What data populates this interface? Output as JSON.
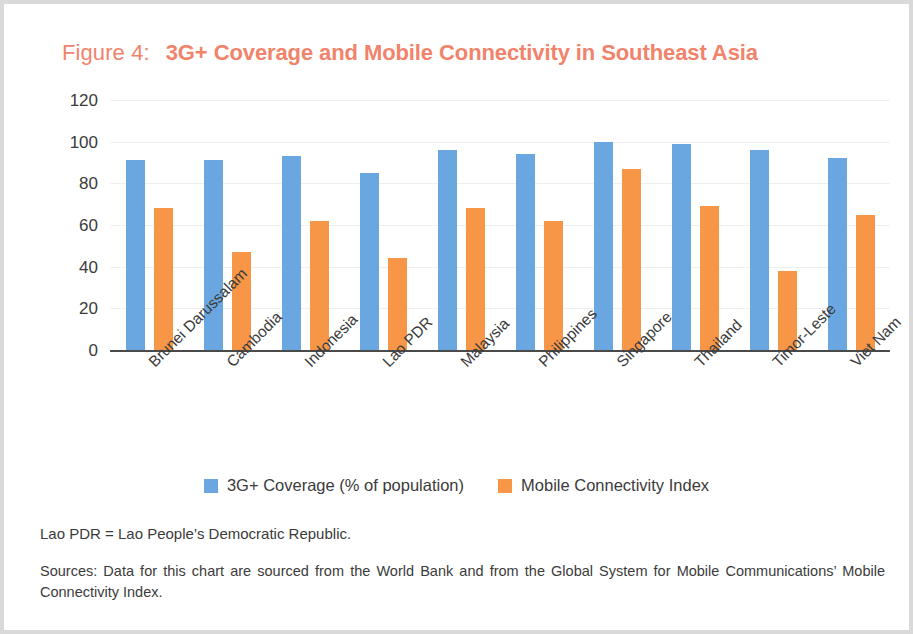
{
  "figure": {
    "label": "Figure 4:",
    "title": "3G+ Coverage and Mobile Connectivity in Southeast Asia"
  },
  "notes": {
    "abbreviation": "Lao PDR = Lao People’s Democratic Republic.",
    "source": "Sources: Data for this chart are sourced from the World Bank and from the Global System for Mobile Communications’ Mobile Connectivity Index."
  },
  "colors": {
    "title": "#f2836b",
    "series_1": "#6aa7e0",
    "series_2": "#f79646",
    "axis": "#4a4a4a",
    "grid": "#efefef",
    "text": "#3b3b3b",
    "frame": "#d9d9d9"
  },
  "chart_data": {
    "type": "bar",
    "title": "3G+ Coverage and Mobile Connectivity in Southeast Asia",
    "xlabel": "",
    "ylabel": "",
    "ylim": [
      0,
      120
    ],
    "yticks": [
      120,
      100,
      80,
      60,
      40,
      20,
      0
    ],
    "grid": true,
    "legend_position": "bottom-center",
    "categories": [
      "Brunei Darussalam",
      "Cambodia",
      "Indonesia",
      "Lao PDR",
      "Malaysia",
      "Philippines",
      "Singapore",
      "Thailand",
      "Timor-Leste",
      "Viet Nam"
    ],
    "series": [
      {
        "name": "3G+ Coverage (% of population)",
        "color": "#6aa7e0",
        "values": [
          91,
          91,
          93,
          85,
          96,
          94,
          100,
          99,
          96,
          92
        ]
      },
      {
        "name": "Mobile Connectivity Index",
        "color": "#f79646",
        "values": [
          68,
          47,
          62,
          44,
          68,
          62,
          87,
          69,
          38,
          65
        ]
      }
    ]
  }
}
